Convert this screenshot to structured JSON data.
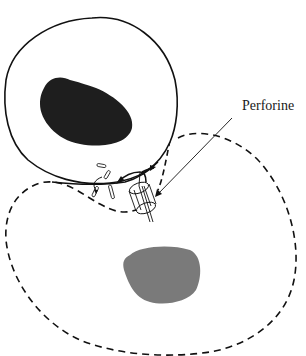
{
  "diagram": {
    "labels": {
      "perforin": "Perforine"
    },
    "colors": {
      "background": "#ffffff",
      "stroke": "#111111",
      "effector_nucleus": "#1e1e1e",
      "target_nucleus": "#7a7a7a"
    },
    "elements": {
      "effector_cell": "solid-outline cell (upper left)",
      "effector_nucleus": "dark nucleus",
      "target_cell": "dashed-outline target cell (lower)",
      "target_nucleus": "gray nucleus",
      "granules": "small granules near synapse",
      "perforin_pore": "cylindrical pore inserted in target membrane",
      "pointer": "line from label to pore"
    }
  }
}
